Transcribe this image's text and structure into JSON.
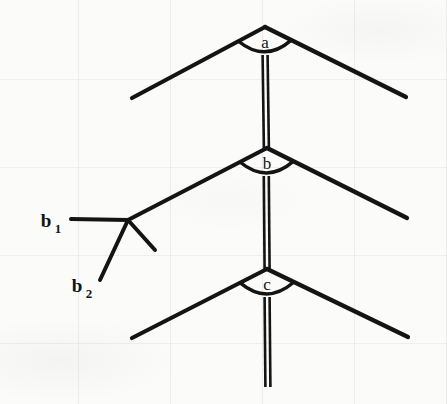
{
  "figure": {
    "kind": "scanned-line-diagram",
    "background_color": "#fbfbfa",
    "ink_color": "#141414",
    "ghost_text": "scanned bleed-through",
    "vertices": [
      {
        "id": "a",
        "label": "a",
        "x": 265,
        "y": 27,
        "label_x": 265,
        "label_y": 48
      },
      {
        "id": "b",
        "label": "b",
        "x": 267,
        "y": 148,
        "label_x": 267,
        "label_y": 169
      },
      {
        "id": "c",
        "label": "c",
        "x": 267,
        "y": 269,
        "label_x": 267,
        "label_y": 290
      }
    ],
    "arms": [
      {
        "vertex": "a",
        "side": "left",
        "x1": 265,
        "y1": 27,
        "x2": 132,
        "y2": 98
      },
      {
        "vertex": "a",
        "side": "right",
        "x1": 265,
        "y1": 27,
        "x2": 406,
        "y2": 97
      },
      {
        "vertex": "b",
        "side": "left",
        "x1": 267,
        "y1": 148,
        "x2": 128,
        "y2": 220
      },
      {
        "vertex": "b",
        "side": "right",
        "x1": 267,
        "y1": 148,
        "x2": 407,
        "y2": 218
      },
      {
        "vertex": "c",
        "side": "left",
        "x1": 267,
        "y1": 269,
        "x2": 132,
        "y2": 338
      },
      {
        "vertex": "c",
        "side": "right",
        "x1": 267,
        "y1": 269,
        "x2": 408,
        "y2": 337
      }
    ],
    "angle_arcs": [
      {
        "vertex": "a",
        "cx": 265,
        "cy": 27,
        "radius": 30
      },
      {
        "vertex": "b",
        "cx": 267,
        "cy": 148,
        "radius": 30
      },
      {
        "vertex": "c",
        "cx": 267,
        "cy": 269,
        "radius": 30
      }
    ],
    "double_lines": [
      {
        "id": "segment-a-b",
        "x": 265,
        "y1": 55,
        "y2": 149,
        "gap": 5
      },
      {
        "id": "segment-b-c",
        "x": 266,
        "y1": 176,
        "y2": 270,
        "gap": 5
      },
      {
        "id": "segment-c-tail",
        "x": 267,
        "y1": 297,
        "y2": 387,
        "gap": 5
      }
    ],
    "leaders": [
      {
        "id": "b1",
        "label": "b",
        "subscript": "1",
        "label_x": 46,
        "label_y": 227,
        "sub_x": 60,
        "sub_y": 233,
        "line": {
          "x1": 71,
          "y1": 219,
          "x2": 128,
          "y2": 220
        }
      },
      {
        "id": "b2",
        "label": "b",
        "subscript": "2",
        "label_x": 77,
        "label_y": 292,
        "sub_x": 91,
        "sub_y": 298,
        "line": {
          "x1": 100,
          "y1": 280,
          "x2": 128,
          "y2": 220
        }
      }
    ],
    "branch_line": {
      "id": "branch-stub",
      "x1": 128,
      "y1": 220,
      "x2": 155,
      "y2": 250
    }
  }
}
